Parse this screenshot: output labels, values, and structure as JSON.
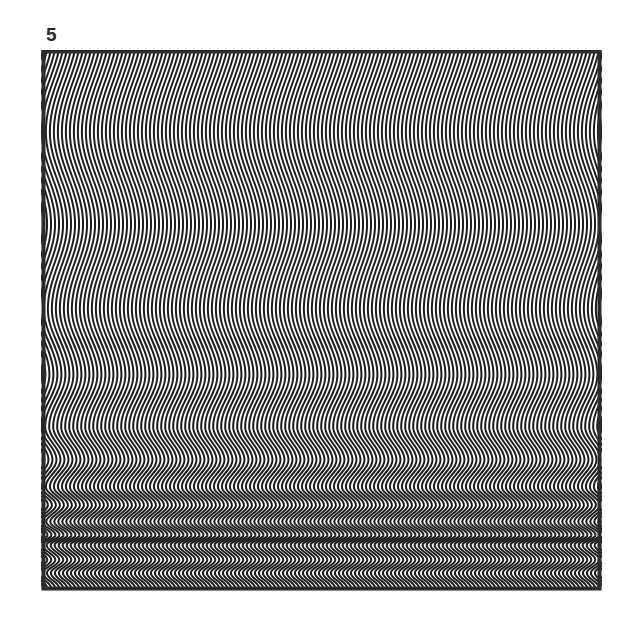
{
  "figure": {
    "label": "5",
    "artwork": {
      "description": "Op-art pattern of vertical black wavy lines on white, wavelength compressing toward the bottom producing moire bands",
      "line_color": "#1e1e1e",
      "background_color": "#ffffff",
      "frame_color": "#2b2b2b",
      "line_spacing_px": 4,
      "half_cycle_rows": [
        51,
        133,
        225,
        310,
        375,
        427,
        460,
        487,
        505,
        522,
        535,
        545,
        560,
        573,
        588
      ]
    }
  }
}
